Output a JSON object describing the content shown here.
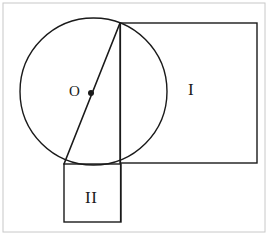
{
  "figure": {
    "type": "geometry-diagram",
    "canvas": {
      "width": 271,
      "height": 236,
      "background": "#ffffff"
    },
    "stroke_color": "#1a1a1a",
    "frame_color": "#c8c8c8",
    "labels": {
      "region_one": "I",
      "region_two": "II",
      "center_point": "O"
    },
    "shapes": {
      "outer_frame": {
        "name": "outer-frame",
        "x": 3,
        "y": 3,
        "width": 262,
        "height": 229,
        "stroke": "#c8c8c8",
        "stroke_width": 1
      },
      "circle": {
        "name": "circle",
        "cx": 93.5,
        "cy": 91.5,
        "r": 73.5,
        "stroke": "#1a1a1a",
        "stroke_width": 1.4,
        "fill": "none"
      },
      "center_dot": {
        "name": "center-dot",
        "cx": 91,
        "cy": 93,
        "r": 3,
        "fill": "#1a1a1a"
      },
      "rectangle_one": {
        "name": "rectangle-region-one",
        "x": 120,
        "y": 23,
        "width": 137,
        "height": 140,
        "stroke": "#1a1a1a",
        "stroke_width": 1.4,
        "fill": "none"
      },
      "rectangle_two": {
        "name": "rectangle-region-two",
        "x": 64,
        "y": 164,
        "width": 57,
        "height": 58,
        "stroke": "#1a1a1a",
        "stroke_width": 1.4,
        "fill": "none"
      },
      "chord_diagonal": {
        "name": "chord-diagonal",
        "x1": 120,
        "y1": 23,
        "x2": 64,
        "y2": 164,
        "stroke": "#1a1a1a",
        "stroke_width": 1.6
      },
      "vertical_chord": {
        "name": "vertical-chord",
        "x1": 120.5,
        "y1": 23,
        "x2": 120.5,
        "y2": 222,
        "stroke": "#1a1a1a",
        "stroke_width": 1.2
      }
    }
  }
}
